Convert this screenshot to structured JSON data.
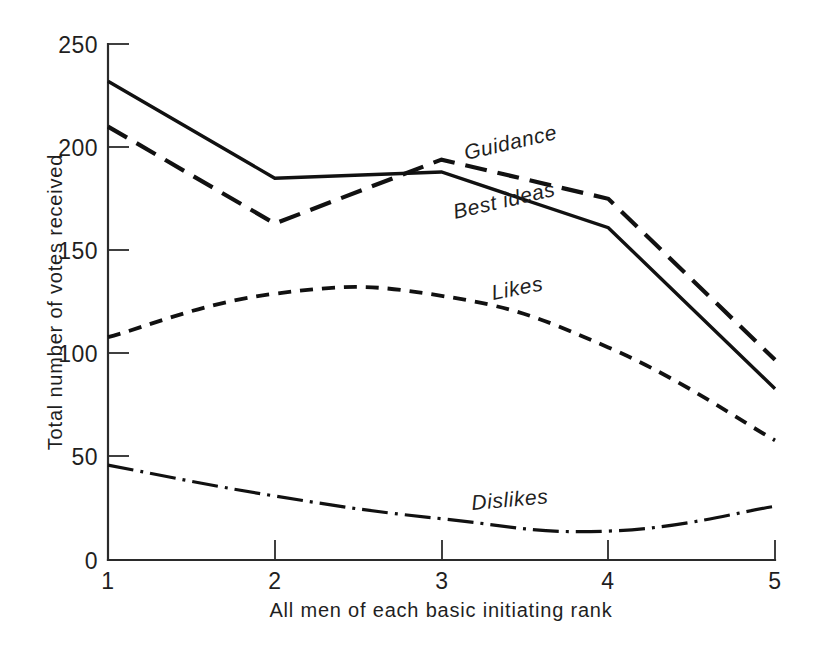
{
  "chart_data": {
    "type": "line",
    "title": "",
    "xlabel": "All men of each basic initiating rank",
    "ylabel": "Total number of votes received",
    "x": [
      1,
      2,
      3,
      4,
      5
    ],
    "xticklabels": [
      "1",
      "2",
      "3",
      "4",
      "5"
    ],
    "yticklabels": [
      "0",
      "50",
      "100",
      "150",
      "200",
      "250"
    ],
    "yticks": [
      0,
      50,
      100,
      150,
      200,
      250
    ],
    "xlim": [
      1,
      5
    ],
    "ylim": [
      0,
      250
    ],
    "grid": false,
    "legend": "inline-curve-labels",
    "series": [
      {
        "name": "Best ideas",
        "style": "solid",
        "values": [
          232,
          185,
          188,
          161,
          83
        ]
      },
      {
        "name": "Guidance",
        "style": "long-dashed",
        "values": [
          210,
          163,
          194,
          175,
          97
        ]
      },
      {
        "name": "Likes",
        "style": "short-dashed",
        "values": [
          108,
          129,
          128,
          103,
          58
        ]
      },
      {
        "name": "Dislikes",
        "style": "dash-dot",
        "values": [
          46,
          31,
          20,
          14,
          26
        ]
      }
    ],
    "annotations": [
      {
        "text": "Guidance",
        "series": "Guidance"
      },
      {
        "text": "Best ideas",
        "series": "Best ideas"
      },
      {
        "text": "Likes",
        "series": "Likes"
      },
      {
        "text": "Dislikes",
        "series": "Dislikes"
      }
    ]
  }
}
